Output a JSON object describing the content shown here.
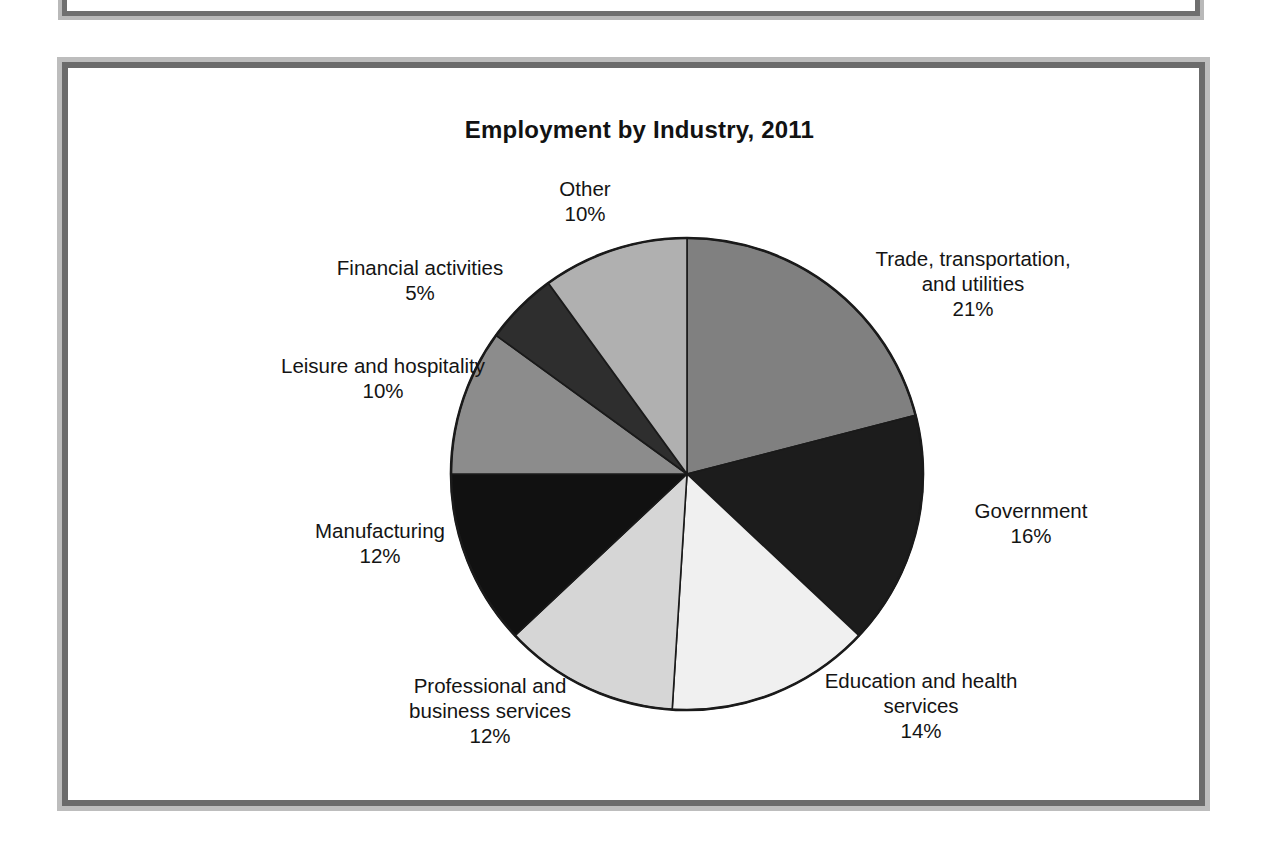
{
  "page": {
    "background_color": "#ffffff",
    "frame_border_color": "#6b6b6b",
    "frame_shadow_color": "#bdbdbd"
  },
  "chart": {
    "title": "Employment by Industry, 2011"
  },
  "chart_data": {
    "type": "pie",
    "title": "Employment by Industry, 2011",
    "xlabel": "",
    "ylabel": "",
    "legend_position": "none",
    "labels_outside": true,
    "start_angle_deg": 90,
    "direction": "clockwise",
    "categories": [
      "Trade, transportation, and utilities",
      "Government",
      "Education and health services",
      "Professional and business services",
      "Manufacturing",
      "Leisure and hospitality",
      "Financial activities",
      "Other"
    ],
    "values": [
      21,
      16,
      14,
      12,
      12,
      10,
      5,
      10
    ],
    "value_unit": "%",
    "colors": [
      "#808080",
      "#1c1c1c",
      "#f0f0f0",
      "#d6d6d6",
      "#111111",
      "#8c8c8c",
      "#2e2e2e",
      "#b0b0b0"
    ],
    "slices": [
      {
        "name": "Trade, transportation, and utilities",
        "label_line1": "Trade, transportation,",
        "label_line2": "and utilities",
        "value": 21,
        "value_text": "21%",
        "color": "#808080"
      },
      {
        "name": "Government",
        "label_line1": "Government",
        "label_line2": "",
        "value": 16,
        "value_text": "16%",
        "color": "#1c1c1c"
      },
      {
        "name": "Education and health services",
        "label_line1": "Education and health",
        "label_line2": "services",
        "value": 14,
        "value_text": "14%",
        "color": "#f0f0f0"
      },
      {
        "name": "Professional and business services",
        "label_line1": "Professional and",
        "label_line2": "business services",
        "value": 12,
        "value_text": "12%",
        "color": "#d6d6d6"
      },
      {
        "name": "Manufacturing",
        "label_line1": "Manufacturing",
        "label_line2": "",
        "value": 12,
        "value_text": "12%",
        "color": "#111111"
      },
      {
        "name": "Leisure and hospitality",
        "label_line1": "Leisure and hospitality",
        "label_line2": "",
        "value": 10,
        "value_text": "10%",
        "color": "#8c8c8c"
      },
      {
        "name": "Financial activities",
        "label_line1": "Financial activities",
        "label_line2": "",
        "value": 5,
        "value_text": "5%",
        "color": "#2e2e2e"
      },
      {
        "name": "Other",
        "label_line1": "Other",
        "label_line2": "",
        "value": 10,
        "value_text": "10%",
        "color": "#b0b0b0"
      }
    ]
  },
  "labels": {
    "other": "Other\n10%",
    "trade": "Trade, transportation,\nand utilities\n21%",
    "government": "Government\n16%",
    "education": "Education and health\nservices\n14%",
    "professional": "Professional and\nbusiness services\n12%",
    "manufacturing": "Manufacturing\n12%",
    "leisure": "Leisure and hospitality\n10%",
    "financial": "Financial activities\n5%"
  }
}
